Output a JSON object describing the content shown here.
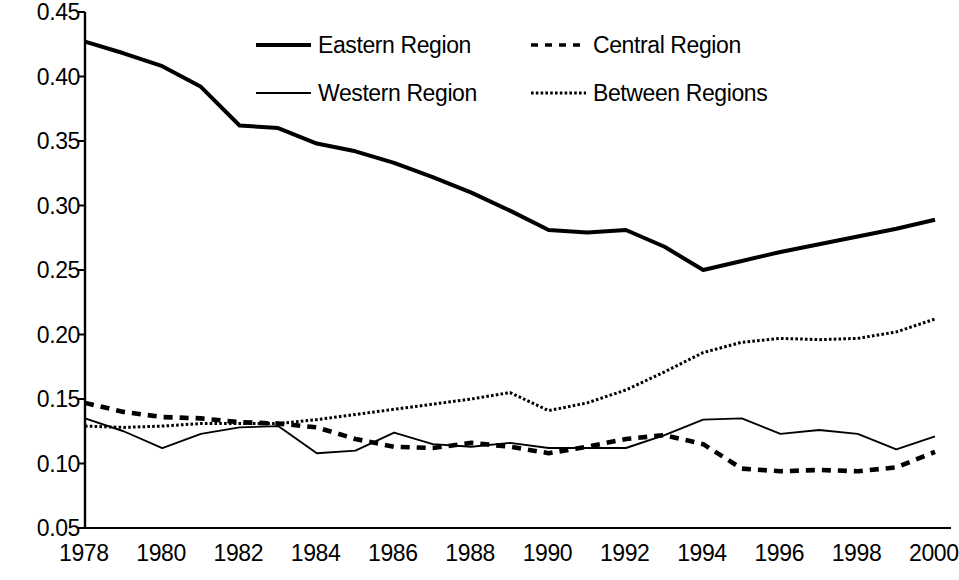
{
  "chart_data": {
    "type": "line",
    "title": "",
    "subtitle": "",
    "xlabel": "",
    "ylabel": "",
    "xlim": [
      1978,
      2000
    ],
    "ylim": [
      0.05,
      0.45
    ],
    "grid": false,
    "legend_position": "top-center",
    "y_ticks": [
      "0.45",
      "0.40",
      "0.35",
      "0.30",
      "0.25",
      "0.20",
      "0.15",
      "0.10",
      "0.05"
    ],
    "y_tick_values": [
      0.45,
      0.4,
      0.35,
      0.3,
      0.25,
      0.2,
      0.15,
      0.1,
      0.05
    ],
    "x_ticks": [
      "1978",
      "1980",
      "1982",
      "1984",
      "1986",
      "1988",
      "1990",
      "1992",
      "1994",
      "1996",
      "1998",
      "2000"
    ],
    "x_tick_values": [
      1978,
      1980,
      1982,
      1984,
      1986,
      1988,
      1990,
      1992,
      1994,
      1996,
      1998,
      2000
    ],
    "x": [
      1978,
      1979,
      1980,
      1981,
      1982,
      1983,
      1984,
      1985,
      1986,
      1987,
      1988,
      1989,
      1990,
      1991,
      1992,
      1993,
      1994,
      1995,
      1996,
      1997,
      1998,
      1999,
      2000
    ],
    "series": [
      {
        "name": "Eastern Region",
        "style": "solid-thick",
        "color": "#000000",
        "values": [
          0.427,
          0.418,
          0.408,
          0.392,
          0.362,
          0.36,
          0.348,
          0.342,
          0.333,
          0.322,
          0.31,
          0.296,
          0.281,
          0.279,
          0.281,
          0.268,
          0.25,
          0.257,
          0.264,
          0.27,
          0.276,
          0.282,
          0.289
        ]
      },
      {
        "name": "Central Region",
        "style": "dashed",
        "color": "#000000",
        "values": [
          0.147,
          0.14,
          0.136,
          0.135,
          0.132,
          0.131,
          0.128,
          0.119,
          0.113,
          0.112,
          0.116,
          0.113,
          0.108,
          0.113,
          0.119,
          0.122,
          0.115,
          0.096,
          0.094,
          0.095,
          0.094,
          0.097,
          0.109
        ]
      },
      {
        "name": "Western Region",
        "style": "solid-thin",
        "color": "#000000",
        "values": [
          0.135,
          0.125,
          0.112,
          0.123,
          0.128,
          0.129,
          0.108,
          0.11,
          0.124,
          0.115,
          0.113,
          0.116,
          0.112,
          0.112,
          0.112,
          0.122,
          0.134,
          0.135,
          0.123,
          0.126,
          0.123,
          0.111,
          0.121
        ]
      },
      {
        "name": "Between Regions",
        "style": "dotted",
        "color": "#000000",
        "values": [
          0.129,
          0.128,
          0.129,
          0.131,
          0.131,
          0.131,
          0.134,
          0.138,
          0.142,
          0.146,
          0.15,
          0.155,
          0.141,
          0.147,
          0.157,
          0.171,
          0.186,
          0.194,
          0.197,
          0.196,
          0.197,
          0.202,
          0.212
        ]
      }
    ]
  },
  "axes": {
    "y_labels": [
      {
        "text": "0.45",
        "value": 0.45
      },
      {
        "text": "0.40",
        "value": 0.4
      },
      {
        "text": "0.35",
        "value": 0.35
      },
      {
        "text": "0.30",
        "value": 0.3
      },
      {
        "text": "0.25",
        "value": 0.25
      },
      {
        "text": "0.20",
        "value": 0.2
      },
      {
        "text": "0.15",
        "value": 0.15
      },
      {
        "text": "0.10",
        "value": 0.1
      },
      {
        "text": "0.05",
        "value": 0.05
      }
    ],
    "x_labels": [
      {
        "text": "1978",
        "value": 1978
      },
      {
        "text": "1980",
        "value": 1980
      },
      {
        "text": "1982",
        "value": 1982
      },
      {
        "text": "1984",
        "value": 1984
      },
      {
        "text": "1986",
        "value": 1986
      },
      {
        "text": "1988",
        "value": 1988
      },
      {
        "text": "1990",
        "value": 1990
      },
      {
        "text": "1992",
        "value": 1992
      },
      {
        "text": "1994",
        "value": 1994
      },
      {
        "text": "1996",
        "value": 1996
      },
      {
        "text": "1998",
        "value": 1998
      },
      {
        "text": "2000",
        "value": 2000
      }
    ]
  },
  "legend": {
    "entries": [
      {
        "label": "Eastern Region",
        "style": "solid-thick"
      },
      {
        "label": "Central Region",
        "style": "dashed"
      },
      {
        "label": "Western Region",
        "style": "solid-thin"
      },
      {
        "label": "Between Regions",
        "style": "dotted"
      }
    ]
  }
}
